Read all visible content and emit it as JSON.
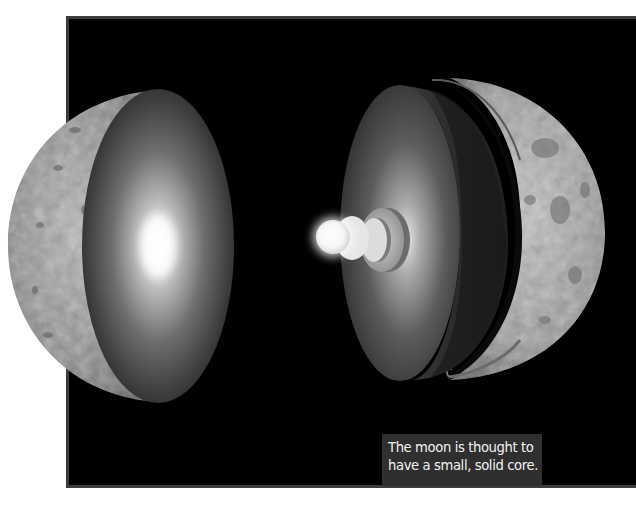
{
  "figure": {
    "background_color": "#000000",
    "frame_border_color": "#3c3c3c",
    "parts": [
      {
        "name": "left-hemisphere",
        "label": "Moon half with cut face"
      },
      {
        "name": "crust-shell",
        "label": "Crust shell"
      },
      {
        "name": "mantle-disc",
        "label": "Mantle"
      },
      {
        "name": "outer-core-ring",
        "label": "Outer core"
      },
      {
        "name": "inner-core",
        "label": "Solid inner core"
      }
    ]
  },
  "caption": {
    "line1": "The moon is thought to",
    "line2": "have a small, solid core.",
    "background_color": "#2f2f2f",
    "text_color": "#f2f2f2"
  }
}
